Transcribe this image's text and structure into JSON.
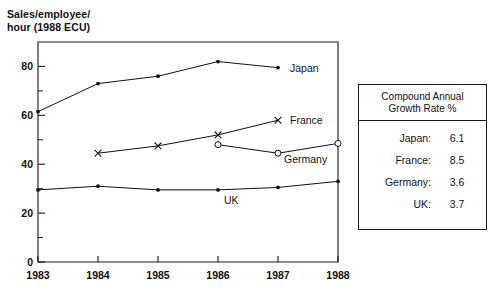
{
  "chart_data": {
    "type": "line",
    "title": "Sales/employee/\nhour (1988 ECU)",
    "xlabel": "",
    "ylabel": "Sales/employee/hour (1988 ECU)",
    "x": [
      1983,
      1984,
      1985,
      1986,
      1987,
      1988
    ],
    "xlim": [
      1983,
      1988
    ],
    "ylim": [
      0,
      90
    ],
    "ytick_labels": [
      "0",
      "20",
      "40",
      "60",
      "80"
    ],
    "ytick_values": [
      0,
      20,
      40,
      60,
      80
    ],
    "yminor_ticks": [
      10,
      30,
      50,
      70
    ],
    "xtick_labels": [
      "1983",
      "1984",
      "1985",
      "1986",
      "1987",
      "1988"
    ],
    "grid": false,
    "legend": "inline series labels at line ends",
    "series": [
      {
        "name": "Japan",
        "marker": "filled-dot",
        "x": [
          1983,
          1984,
          1985,
          1986,
          1987
        ],
        "values": [
          61.5,
          73.0,
          76.0,
          82.0,
          79.5
        ]
      },
      {
        "name": "France",
        "marker": "x-cross",
        "x": [
          1984,
          1985,
          1986,
          1987
        ],
        "values": [
          44.5,
          47.5,
          52.0,
          58.0
        ]
      },
      {
        "name": "Germany",
        "marker": "open-circle",
        "x": [
          1986,
          1987,
          1988
        ],
        "values": [
          48.0,
          44.5,
          48.5
        ]
      },
      {
        "name": "UK",
        "marker": "filled-dot",
        "x": [
          1983,
          1984,
          1985,
          1986,
          1987,
          1988
        ],
        "values": [
          29.5,
          31.0,
          29.5,
          29.5,
          30.5,
          33.0
        ]
      }
    ],
    "series_labels": [
      {
        "text": "Japan",
        "x": 1987.2,
        "y": 79.5
      },
      {
        "text": "France",
        "x": 1987.2,
        "y": 58.0
      },
      {
        "text": "Germany",
        "x": 1987.1,
        "y": 42.0
      },
      {
        "text": "UK",
        "x": 1986.1,
        "y": 25.5
      }
    ]
  },
  "growth_table": {
    "header": "Compound Annual\nGrowth Rate %",
    "rows": [
      {
        "label": "Japan:",
        "value": "6.1"
      },
      {
        "label": "France:",
        "value": "8.5"
      },
      {
        "label": "Germany:",
        "value": "3.6"
      },
      {
        "label": "UK:",
        "value": "3.7"
      }
    ]
  },
  "colors": {
    "ink": "#111111",
    "frame": "#1a1a1a",
    "background": "#ffffff"
  }
}
